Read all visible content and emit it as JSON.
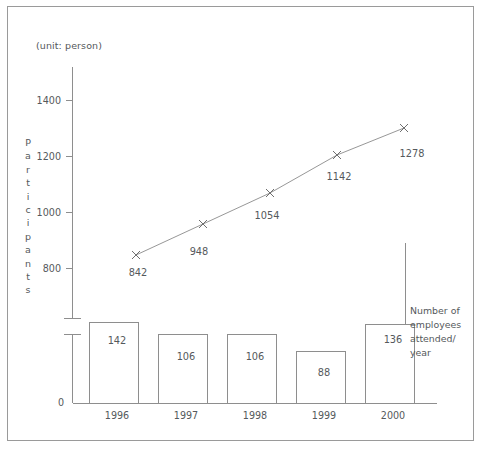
{
  "figure": {
    "unit_label": "(unit: person)",
    "yaxis_title": "Participants",
    "right_note_lines": [
      "Number of",
      "employees",
      "attended/",
      "year"
    ],
    "colors": {
      "frame": "#9a9a9a",
      "axis": "#8e8e8e",
      "line": "#8b8b8b",
      "marker": "#6f6f6f",
      "bar_fill": "#ffffff",
      "bar_stroke": "#8e8e8e",
      "text": "#55595c",
      "background": "#ffffff"
    }
  },
  "chart_data": {
    "type": "bar",
    "title": "",
    "subtitle": "(unit: person)",
    "xlabel": "",
    "ylabel": "Participants",
    "categories": [
      "1996",
      "1997",
      "1998",
      "1999",
      "2000"
    ],
    "grid": false,
    "legend": "none",
    "axis_break": true,
    "yticks_upper": [
      "1400",
      "1200",
      "1000",
      "800"
    ],
    "ytick_zero": "0",
    "ylim_upper": [
      800,
      1400
    ],
    "series": [
      {
        "name": "Participants",
        "type": "line",
        "marker": "x",
        "values": [
          842,
          948,
          1054,
          1142,
          1278
        ],
        "labels": [
          "842",
          "948",
          "1054",
          "1142",
          "1278"
        ]
      },
      {
        "name": "Number of employees attended/ year",
        "type": "bar",
        "values": [
          142,
          106,
          106,
          88,
          136
        ],
        "labels": [
          "142",
          "106",
          "106",
          "88",
          "136"
        ]
      }
    ]
  }
}
